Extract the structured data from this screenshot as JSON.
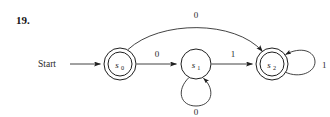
{
  "figure": {
    "exercise_number": "19.",
    "start_label": "Start",
    "caption": ""
  },
  "automaton": {
    "states": [
      {
        "id": "s0",
        "name": "s",
        "subscript": "0",
        "accepting": true,
        "cx": 120,
        "cy": 64,
        "r_outer": 16,
        "r_inner": 12
      },
      {
        "id": "s1",
        "name": "s",
        "subscript": "1",
        "accepting": false,
        "cx": 196,
        "cy": 64,
        "r_outer": 15,
        "r_inner": 0
      },
      {
        "id": "s2",
        "name": "s",
        "subscript": "2",
        "accepting": true,
        "cx": 272,
        "cy": 64,
        "r_outer": 16,
        "r_inner": 12
      }
    ],
    "start_state": "s0",
    "transitions": [
      {
        "id": "t-s0-s1",
        "from": "s0",
        "to": "s1",
        "label": "0",
        "shape": "straight",
        "label_x": 157,
        "label_y": 57
      },
      {
        "id": "t-s1-s2",
        "from": "s1",
        "to": "s2",
        "label": "1",
        "shape": "straight",
        "label_x": 233,
        "label_y": 57
      },
      {
        "id": "t-s0-s2",
        "from": "s0",
        "to": "s2",
        "label": "0",
        "shape": "arc-over",
        "label_x": 196,
        "label_y": 18
      },
      {
        "id": "t-s1-s1",
        "from": "s1",
        "to": "s1",
        "label": "0",
        "shape": "self-below",
        "label_x": 196,
        "label_y": 113
      },
      {
        "id": "t-s2-s2",
        "from": "s2",
        "to": "s2",
        "label": "1",
        "shape": "self-right",
        "label_x": 326,
        "label_y": 68
      }
    ]
  }
}
